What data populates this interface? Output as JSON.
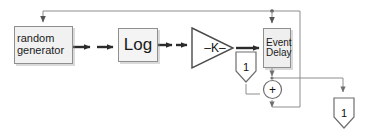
{
  "diagram": {
    "type": "block-diagram",
    "colors": {
      "block_fill": "#f1f1f1",
      "block_border": "#8f8f8f",
      "wire": "#3a3a3a",
      "wire_light": "#9a9a9a",
      "shape_outline": "#6e6e6e",
      "text": "#1a1a1a",
      "background": "#ffffff"
    },
    "blocks": {
      "random_generator": {
        "label_line1": "random",
        "label_line2": "generator",
        "icon": "rectangle-block"
      },
      "log": {
        "label": "Log",
        "icon": "rectangle-block"
      },
      "gain": {
        "label": "–K–",
        "icon": "triangle-gain"
      },
      "event_delay": {
        "label_line1": "Event",
        "label_line2": "Delay",
        "icon": "rectangle-block"
      },
      "constant_one": {
        "label": "1",
        "icon": "pentagon-terminator"
      },
      "sum_junction": {
        "label": "+",
        "icon": "circle-sum"
      },
      "output_one": {
        "label": "1",
        "icon": "pentagon-terminator"
      }
    }
  }
}
